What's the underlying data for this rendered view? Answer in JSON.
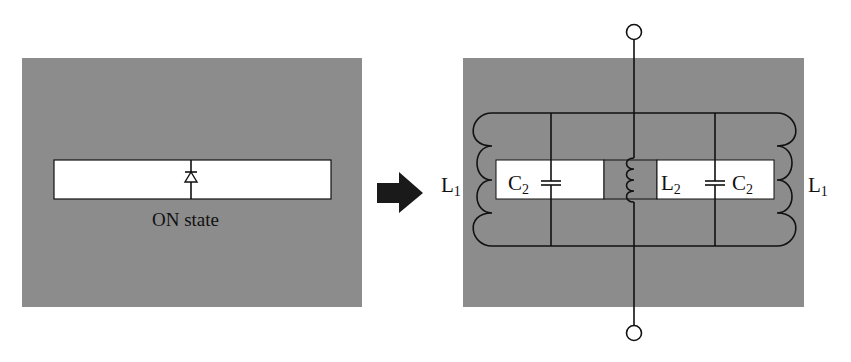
{
  "diagram": {
    "colors": {
      "panel": "#8c8c8c",
      "strip": "#ffffff",
      "line": "#111111",
      "arrow": "#1a1a1a"
    },
    "left_panel": {
      "state_label": "ON state",
      "component": "diode"
    },
    "transform_arrow": "right-arrow",
    "right_panel": {
      "labels": {
        "l1_left": "L",
        "l1_left_sub": "1",
        "c2_left": "C",
        "c2_left_sub": "2",
        "l2": "L",
        "l2_sub": "2",
        "c2_right": "C",
        "c2_right_sub": "2",
        "l1_right": "L",
        "l1_right_sub": "1"
      },
      "components": [
        "L1 (left coil)",
        "C2 (left capacitor)",
        "L2 (center inductor)",
        "C2 (right capacitor)",
        "L1 (right coil)"
      ],
      "terminals": [
        "top-terminal",
        "bottom-terminal"
      ]
    }
  }
}
